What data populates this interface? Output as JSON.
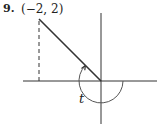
{
  "problem": {
    "number": "9.",
    "point_label": "(−2, 2)",
    "angle_label": "t"
  },
  "diagram": {
    "point": {
      "x": -2,
      "y": 2
    },
    "terminal_side_direction_deg": 135,
    "angle_direction": "clockwise",
    "angle_measure_deg": -225,
    "colors": {
      "stroke": "#333333",
      "background": "#ffffff"
    }
  }
}
